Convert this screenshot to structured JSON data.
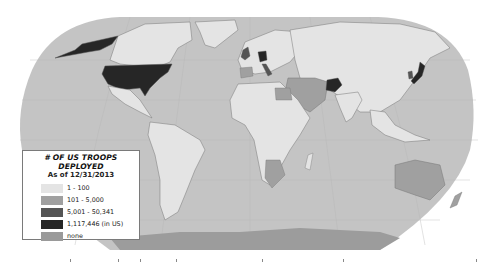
{
  "map": {
    "projection": "Robinson world map",
    "ocean_color": "#c4c4c4",
    "antarctica_color": "#9c9c9c",
    "background_color": "#ffffff"
  },
  "legend": {
    "title": "# OF US TROOPS DEPLOYED",
    "subtitle": "As of 12/31/2013",
    "items": [
      {
        "label": "1 - 100",
        "color": "#e4e4e4"
      },
      {
        "label": "101 - 5,000",
        "color": "#a0a0a0"
      },
      {
        "label": "5,001 - 50,341",
        "color": "#555555"
      },
      {
        "label": "1,117,446 (in US)",
        "color": "#262626"
      },
      {
        "label": "none",
        "color": "#9a9a9a"
      }
    ]
  },
  "highlighted_regions": [
    {
      "name": "United States",
      "category": "1,117,446 (in US)"
    },
    {
      "name": "Alaska",
      "category": "1,117,446 (in US)"
    },
    {
      "name": "Germany",
      "category": "5,001 - 50,341"
    },
    {
      "name": "United Kingdom",
      "category": "5,001 - 50,341"
    },
    {
      "name": "Italy",
      "category": "5,001 - 50,341"
    },
    {
      "name": "Afghanistan",
      "category": "5,001 - 50,341"
    },
    {
      "name": "Japan",
      "category": "5,001 - 50,341"
    },
    {
      "name": "South Korea",
      "category": "5,001 - 50,341"
    }
  ]
}
